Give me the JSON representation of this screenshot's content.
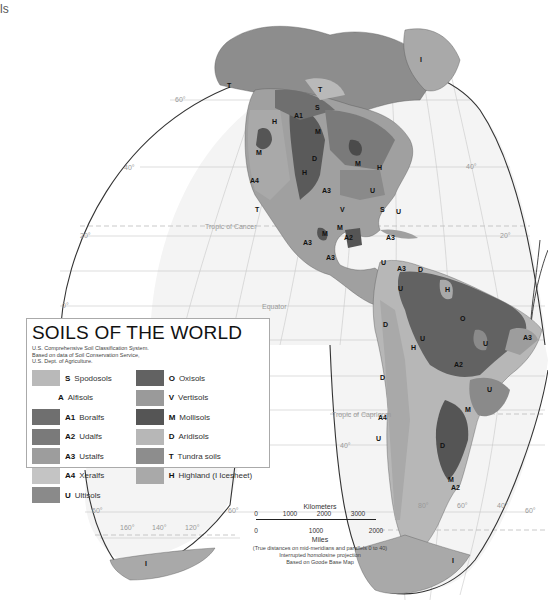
{
  "corner_text": "ls",
  "legend": {
    "title": "SOILS OF THE WORLD",
    "subtitle_lines": [
      "U.S. Comprehensive Soil Classification System.",
      "Based on data of Soil Conservation Service,",
      "U.S. Dept. of Agriculture."
    ],
    "left": [
      {
        "code": "S",
        "name": "Spodosols",
        "color": "#b9b9b9",
        "swatch": true
      },
      {
        "code": "A",
        "name": "Alfisols",
        "color": "",
        "swatch": false
      },
      {
        "code": "A1",
        "name": "Boralfs",
        "color": "#6f6f6f",
        "swatch": true
      },
      {
        "code": "A2",
        "name": "Udalfs",
        "color": "#7a7a7a",
        "swatch": true
      },
      {
        "code": "A3",
        "name": "Ustalfs",
        "color": "#9d9d9d",
        "swatch": true
      },
      {
        "code": "A4",
        "name": "Xeralfs",
        "color": "#c4c4c4",
        "swatch": true
      },
      {
        "code": "U",
        "name": "Ultisols",
        "color": "#8a8a8a",
        "swatch": true
      }
    ],
    "right": [
      {
        "code": "O",
        "name": "Oxisols",
        "color": "#626262",
        "swatch": true
      },
      {
        "code": "V",
        "name": "Vertisols",
        "color": "#9a9a9a",
        "swatch": true
      },
      {
        "code": "M",
        "name": "Mollisols",
        "color": "#555555",
        "swatch": true
      },
      {
        "code": "D",
        "name": "Aridisols",
        "color": "#b7b7b7",
        "swatch": true
      },
      {
        "code": "T",
        "name": "Tundra soils",
        "color": "#8d8d8d",
        "swatch": true
      },
      {
        "code": "H",
        "name": "Highland (I  Icesheet)",
        "color": "#a9a9a9",
        "swatch": true
      }
    ]
  },
  "scale": {
    "km_label": "Kilometers",
    "km_ticks": [
      "0",
      "1000",
      "2000",
      "3000"
    ],
    "mi_ticks": [
      "0",
      "1000",
      "2000"
    ],
    "mi_label": "Miles",
    "notes": [
      "(True distances on mid-meridians and parallels 0 to 40)",
      "Interrupted homolosine projection",
      "Based on Goode Base Map"
    ]
  },
  "map": {
    "graticule_labels": {
      "lat_60_n": "60°",
      "lat_40_n": "40°",
      "lat_20_n": "20°",
      "lat_0": "0°",
      "lat_40_e": "40°",
      "lat_20_e": "20°",
      "lat_40_s": "40°",
      "lat_60_s_w": "60°",
      "lat_60_s_e": "60°",
      "lat_60_s_far": "60°",
      "lon_160": "160°",
      "lon_140": "140°",
      "lon_120": "120°",
      "lon_80": "80°",
      "lon_60": "60°",
      "lon_40": "40°"
    },
    "tropic_cancer": "Tropic of Cancer",
    "equator": "Equator",
    "tropic_capricorn": "Tropic of Capricorn",
    "region_labels": [
      "T",
      "T",
      "S",
      "A1",
      "H",
      "M",
      "M",
      "T",
      "M",
      "D",
      "H",
      "A4",
      "A3",
      "H",
      "U",
      "V",
      "S",
      "U",
      "M",
      "A3",
      "A2",
      "M",
      "A3",
      "A3",
      "U",
      "A3",
      "D",
      "U",
      "H",
      "D",
      "O",
      "U",
      "H",
      "U",
      "A3",
      "A2",
      "D",
      "U",
      "A4",
      "M",
      "U",
      "D",
      "M",
      "A2",
      "I",
      "I",
      "I"
    ]
  }
}
